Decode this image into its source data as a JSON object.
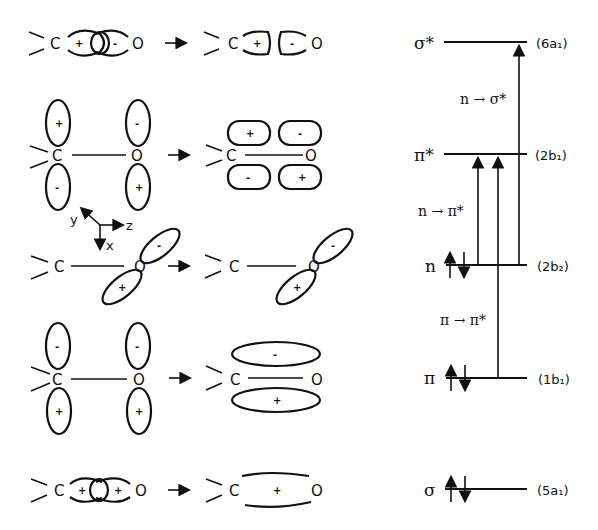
{
  "figure": {
    "type": "molecular-orbital-diagram",
    "molecule": "formaldehyde C=O group"
  },
  "atoms": {
    "carbon": "C",
    "oxygen": "O"
  },
  "signs": {
    "plus": "+",
    "minus": "-"
  },
  "axes": {
    "x": "x",
    "y": "y",
    "z": "z"
  },
  "orbital_rows": [
    {
      "name": "sigma-star",
      "left_signs": [
        "+",
        "-"
      ],
      "right_signs": [
        "+",
        "-"
      ]
    },
    {
      "name": "pi-star",
      "left_signs": [
        "+",
        "-",
        "-",
        "+"
      ],
      "right_signs": [
        "+",
        "-",
        "-",
        "+"
      ]
    },
    {
      "name": "n",
      "left_signs": [
        "-",
        "+"
      ],
      "right_signs": [
        "-",
        "+"
      ]
    },
    {
      "name": "pi",
      "left_signs": [
        "-",
        "+",
        "-",
        "+"
      ],
      "right_signs": [
        "-",
        "+"
      ]
    },
    {
      "name": "sigma",
      "left_signs": [
        "+",
        "+"
      ],
      "right_signs": [
        "+"
      ]
    }
  ],
  "energy_levels": [
    {
      "label": "σ*",
      "symmetry": "(6a₁)",
      "electrons": 0
    },
    {
      "label": "π*",
      "symmetry": "(2b₁)",
      "electrons": 0
    },
    {
      "label": "n",
      "symmetry": "(2b₂)",
      "electrons": 2
    },
    {
      "label": "π",
      "symmetry": "(1b₁)",
      "electrons": 2
    },
    {
      "label": "σ",
      "symmetry": "(5a₁)",
      "electrons": 2
    }
  ],
  "transitions": [
    {
      "label": "n → σ*",
      "from": "n",
      "to": "σ*"
    },
    {
      "label": "n → π*",
      "from": "n",
      "to": "π*"
    },
    {
      "label": "π → π*",
      "from": "π",
      "to": "π*"
    }
  ]
}
